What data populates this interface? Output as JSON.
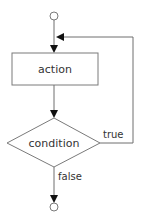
{
  "diagram": {
    "type": "flowchart",
    "nodes": {
      "start": {
        "kind": "start-circle"
      },
      "action": {
        "kind": "process",
        "label": "action"
      },
      "condition": {
        "kind": "decision",
        "label": "condition"
      },
      "end": {
        "kind": "end-circle"
      }
    },
    "edges": [
      {
        "from": "start",
        "to": "action",
        "label": ""
      },
      {
        "from": "action",
        "to": "condition",
        "label": ""
      },
      {
        "from": "condition",
        "to": "action",
        "label": "true"
      },
      {
        "from": "condition",
        "to": "end",
        "label": "false"
      }
    ],
    "labels": {
      "action": "action",
      "condition": "condition",
      "true": "true",
      "false": "false"
    }
  }
}
